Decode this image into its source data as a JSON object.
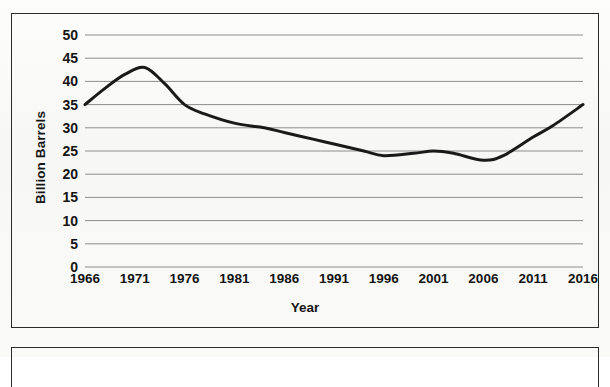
{
  "chart_data": {
    "type": "line",
    "title": "",
    "xlabel": "Year",
    "ylabel": "Billion Barrels",
    "xlim": [
      1966,
      2016
    ],
    "ylim": [
      0,
      50
    ],
    "grid": true,
    "legend": "none",
    "y_ticks": [
      "50",
      "45",
      "40",
      "35",
      "30",
      "25",
      "20",
      "15",
      "10",
      "5",
      "0"
    ],
    "x_ticks": [
      "1966",
      "1971",
      "1976",
      "1981",
      "1986",
      "1991",
      "1996",
      "2001",
      "2006",
      "2011",
      "2016"
    ],
    "series": [
      {
        "name": "Oil discoveries",
        "color": "#1a1a1a",
        "x": [
          1966,
          1968,
          1970,
          1972,
          1974,
          1976,
          1978,
          1981,
          1984,
          1986,
          1989,
          1991,
          1994,
          1996,
          1999,
          2001,
          2003,
          2006,
          2008,
          2011,
          2013,
          2016
        ],
        "values": [
          35.0,
          38.5,
          41.5,
          43.0,
          39.5,
          35.0,
          33.0,
          31.0,
          30.0,
          29.0,
          27.5,
          26.5,
          25.0,
          24.0,
          24.5,
          25.0,
          24.5,
          23.0,
          24.0,
          28.0,
          30.5,
          35.0
        ]
      }
    ]
  },
  "axes": {
    "y_axis_title": "Billion Barrels",
    "x_axis_title": "Year"
  }
}
